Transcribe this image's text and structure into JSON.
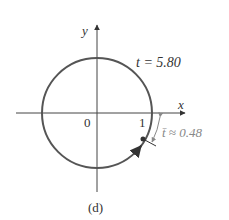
{
  "figure": {
    "caption": "(d)",
    "axes": {
      "x_label": "x",
      "y_label": "y",
      "origin_label": "0",
      "unit_label": "1"
    },
    "annotations": {
      "t_label": "t = 5.80",
      "tbar_label": "t̄ ≈ 0.48"
    },
    "colors": {
      "circle": "#555555",
      "axis": "#444444",
      "reference": "#888888"
    }
  }
}
